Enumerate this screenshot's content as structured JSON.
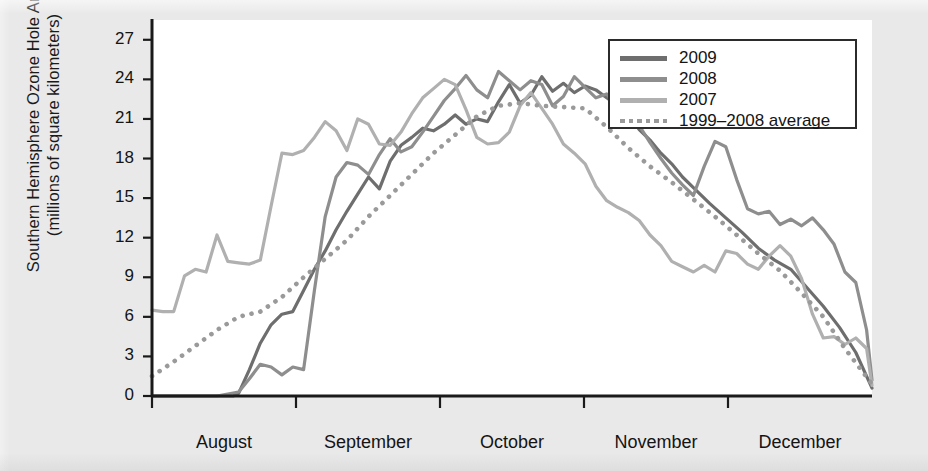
{
  "axes": {
    "ylabel_line1": "Southern Hemisphere Ozone Hole Area",
    "ylabel_line2": "(millions of square kilometers)",
    "yticks": [
      "0",
      "3",
      "6",
      "9",
      "12",
      "15",
      "18",
      "21",
      "24",
      "27"
    ],
    "xticks": [
      "August",
      "September",
      "October",
      "November",
      "December"
    ]
  },
  "legend": {
    "items": [
      {
        "label": "2009",
        "color": "#6e6e6e",
        "style": "solid"
      },
      {
        "label": "2008",
        "color": "#8e8e8e",
        "style": "solid"
      },
      {
        "label": "2007",
        "color": "#b0b0b0",
        "style": "solid"
      },
      {
        "label": "1999–2008 average",
        "color": "#9a9a9a",
        "style": "dotted"
      }
    ]
  },
  "colors": {
    "background": "#e9e9e9",
    "plot_background": "#ffffff",
    "axis": "#1a1a1a",
    "series_2009": "#6e6e6e",
    "series_2008": "#8e8e8e",
    "series_2007": "#b0b0b0",
    "series_average": "#9a9a9a"
  },
  "chart_data": {
    "type": "line",
    "title": "",
    "xlabel": "",
    "ylabel": "Southern Hemisphere Ozone Hole Area (millions of square kilometers)",
    "ylim": [
      0,
      28.5
    ],
    "yticks": [
      0,
      3,
      6,
      9,
      12,
      15,
      18,
      21,
      24,
      27
    ],
    "xlim": [
      "August 1",
      "December 31"
    ],
    "x_tick_labels": [
      "August",
      "September",
      "October",
      "November",
      "December"
    ],
    "x_unit": "day of year (Aug 1 – Dec 31)",
    "grid": false,
    "legend_position": "top-right",
    "series": [
      {
        "name": "2009",
        "color": "#6e6e6e",
        "style": "solid",
        "x": [
          0,
          3,
          6,
          9,
          12,
          15,
          16,
          18,
          20,
          22,
          24,
          26,
          28,
          30,
          32,
          34,
          36,
          38,
          40,
          42,
          44,
          46,
          48,
          50,
          52,
          54,
          56,
          58,
          60,
          62,
          64,
          66,
          68,
          70,
          72,
          74,
          76,
          78,
          80,
          82,
          84,
          86,
          88,
          90,
          92,
          94,
          96,
          98,
          100,
          103,
          106,
          109,
          112,
          115,
          118,
          121,
          124,
          127,
          130,
          133
        ],
        "y": [
          0,
          0,
          0,
          0,
          0,
          0,
          0.2,
          2.0,
          4.0,
          5.4,
          6.2,
          6.4,
          8.0,
          9.6,
          11.0,
          12.6,
          14.0,
          15.3,
          16.6,
          15.7,
          17.8,
          19.0,
          19.6,
          20.3,
          20.1,
          20.6,
          21.3,
          20.6,
          21.0,
          20.8,
          22.3,
          23.6,
          22.2,
          22.8,
          24.2,
          23.1,
          23.7,
          23.0,
          23.5,
          23.2,
          22.6,
          22.0,
          21.3,
          20.2,
          19.4,
          18.4,
          17.6,
          16.6,
          15.8,
          14.6,
          13.5,
          12.4,
          11.2,
          10.3,
          9.6,
          8.2,
          6.8,
          5.2,
          3.3,
          0.6
        ]
      },
      {
        "name": "2008",
        "color": "#8e8e8e",
        "style": "solid",
        "x": [
          0,
          4,
          8,
          12,
          16,
          18,
          20,
          22,
          24,
          26,
          28,
          30,
          32,
          34,
          36,
          38,
          40,
          42,
          44,
          46,
          48,
          50,
          52,
          54,
          56,
          58,
          60,
          62,
          64,
          66,
          68,
          70,
          72,
          74,
          76,
          78,
          80,
          82,
          84,
          86,
          88,
          90,
          92,
          94,
          96,
          98,
          100,
          102,
          104,
          106,
          108,
          110,
          112,
          114,
          116,
          118,
          120,
          122,
          124,
          126,
          128,
          130,
          132,
          133
        ],
        "y": [
          0,
          0,
          0,
          0,
          0.3,
          1.3,
          2.4,
          2.2,
          1.6,
          2.2,
          2.0,
          8.0,
          13.6,
          16.6,
          17.7,
          17.5,
          16.8,
          18.3,
          19.5,
          18.5,
          18.9,
          20.0,
          21.2,
          22.4,
          23.3,
          24.3,
          23.2,
          22.6,
          24.6,
          23.9,
          23.2,
          23.9,
          23.6,
          22.0,
          22.7,
          24.2,
          23.4,
          22.6,
          22.9,
          21.9,
          21.4,
          20.5,
          19.2,
          18.0,
          16.9,
          16.0,
          15.2,
          17.4,
          19.3,
          18.9,
          16.4,
          14.2,
          13.8,
          14.0,
          13.0,
          13.4,
          12.9,
          13.5,
          12.6,
          11.5,
          9.4,
          8.6,
          5.0,
          1.2
        ]
      },
      {
        "name": "2007",
        "color": "#b0b0b0",
        "style": "solid",
        "x": [
          0,
          2,
          4,
          6,
          8,
          10,
          12,
          14,
          16,
          18,
          20,
          22,
          24,
          26,
          28,
          30,
          32,
          34,
          36,
          38,
          40,
          42,
          44,
          46,
          48,
          50,
          52,
          54,
          56,
          58,
          60,
          62,
          64,
          66,
          68,
          70,
          72,
          74,
          76,
          78,
          80,
          82,
          84,
          86,
          88,
          90,
          92,
          94,
          96,
          98,
          100,
          102,
          104,
          106,
          108,
          110,
          112,
          114,
          116,
          118,
          120,
          122,
          124,
          126,
          128,
          130,
          132,
          133
        ],
        "y": [
          6.5,
          6.4,
          6.4,
          9.1,
          9.6,
          9.4,
          12.2,
          10.2,
          10.1,
          10.0,
          10.3,
          14.4,
          18.4,
          18.3,
          18.6,
          19.6,
          20.8,
          20.1,
          18.6,
          21.0,
          20.6,
          19.1,
          19.0,
          20.0,
          21.4,
          22.6,
          23.3,
          24.0,
          23.6,
          21.7,
          19.6,
          19.1,
          19.2,
          20.0,
          22.0,
          23.0,
          21.8,
          20.6,
          19.1,
          18.4,
          17.6,
          15.9,
          14.8,
          14.3,
          13.9,
          13.3,
          12.2,
          11.4,
          10.2,
          9.8,
          9.4,
          9.9,
          9.4,
          11.0,
          10.8,
          10.0,
          9.6,
          10.6,
          11.4,
          10.6,
          8.9,
          6.2,
          4.4,
          4.5,
          3.9,
          4.4,
          3.6,
          0.8
        ]
      },
      {
        "name": "1999–2008 average",
        "color": "#9a9a9a",
        "style": "dotted",
        "x": [
          0,
          4,
          8,
          12,
          16,
          20,
          24,
          28,
          32,
          36,
          40,
          44,
          48,
          52,
          56,
          60,
          64,
          68,
          72,
          76,
          80,
          84,
          88,
          92,
          96,
          100,
          104,
          108,
          112,
          116,
          120,
          124,
          128,
          133
        ],
        "y": [
          1.5,
          2.6,
          3.8,
          5.0,
          6.0,
          6.4,
          7.5,
          9.0,
          10.4,
          11.8,
          13.6,
          15.2,
          16.8,
          18.4,
          19.8,
          21.2,
          22.0,
          22.2,
          22.0,
          21.9,
          21.8,
          20.4,
          18.8,
          17.4,
          16.2,
          14.9,
          13.6,
          12.2,
          10.8,
          9.5,
          7.8,
          6.0,
          3.6,
          0.9
        ]
      }
    ]
  }
}
